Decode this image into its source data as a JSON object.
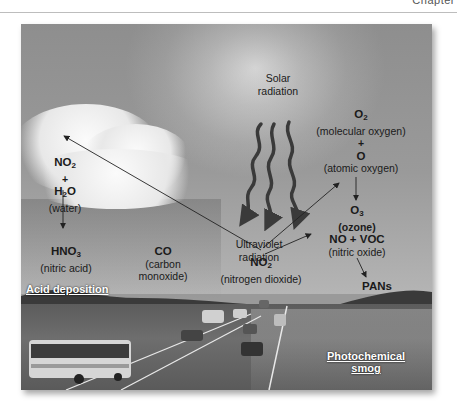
{
  "page": {
    "chapter_tag": "Chapter"
  },
  "figure": {
    "solar": {
      "line1": "Solar",
      "line2": "radiation"
    },
    "uv": {
      "line1": "Ultraviolet",
      "line2": "radiation"
    },
    "o2": {
      "formula_base": "O",
      "formula_sub": "2",
      "name": "(molecular oxygen)"
    },
    "plus_right": "+",
    "o": {
      "formula": "O",
      "name": "(atomic oxygen)"
    },
    "o3": {
      "formula_base": "O",
      "formula_sub": "3",
      "name": "(ozone)"
    },
    "no2_cloud": {
      "formula_base": "NO",
      "formula_sub": "2"
    },
    "plus_left": "+",
    "h2o": {
      "base1": "H",
      "sub": "2",
      "base2": "O",
      "name": "(water)"
    },
    "hno3": {
      "formula_base": "HNO",
      "formula_sub": "3",
      "name": "(nitric acid)"
    },
    "co": {
      "formula": "CO",
      "name1": "(carbon",
      "name2": "monoxide)"
    },
    "no2_center": {
      "formula_base": "NO",
      "formula_sub": "2",
      "name": "(nitrogen dioxide)"
    },
    "no_voc": {
      "formula": "NO + VOC",
      "name": "(nitric oxide)"
    },
    "pans": "PANs",
    "captions": {
      "acid_deposition": "Acid deposition",
      "photochemical_smog_1": "Photochemical",
      "photochemical_smog_2": "smog"
    }
  }
}
